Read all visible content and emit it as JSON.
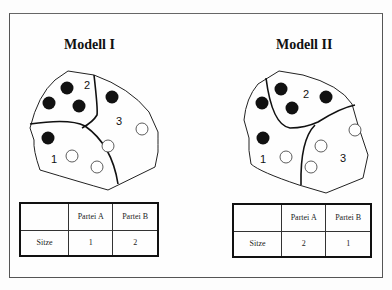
{
  "models": [
    {
      "title": "Modell I",
      "districts": [
        "1",
        "2",
        "3"
      ],
      "table": {
        "headers": [
          "",
          "Partei A",
          "Partei B"
        ],
        "row_label": "Sitze",
        "values": [
          "1",
          "2"
        ]
      }
    },
    {
      "title": "Modell II",
      "districts": [
        "1",
        "2",
        "3"
      ],
      "table": {
        "headers": [
          "",
          "Partei A",
          "Partei B"
        ],
        "row_label": "Sitze",
        "values": [
          "2",
          "1"
        ]
      }
    }
  ],
  "legend": {
    "filled_circle": "voter party A (black)",
    "open_circle": "voter party B (white)"
  },
  "colors": {
    "filled": "#111111",
    "outline": "#222222"
  }
}
